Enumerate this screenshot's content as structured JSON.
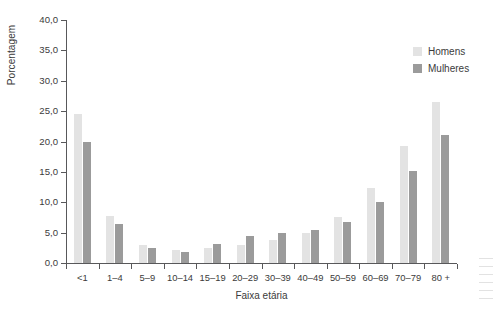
{
  "chart_data": {
    "type": "bar",
    "title": "",
    "xlabel": "Faixa etária",
    "ylabel": "Porcentagem",
    "ylim": [
      0,
      40
    ],
    "ytick_labels": [
      "0,0",
      "5,0",
      "10,0",
      "15,0",
      "20,0",
      "25,0",
      "30,0",
      "35,0",
      "40,0"
    ],
    "ytick_values": [
      0,
      5,
      10,
      15,
      20,
      25,
      30,
      35,
      40
    ],
    "grid": false,
    "legend_position": "top-right",
    "categories": [
      "<1",
      "1–4",
      "5–9",
      "10–14",
      "15–19",
      "20–29",
      "30–39",
      "40–49",
      "50–59",
      "60–69",
      "70–79",
      "80 +"
    ],
    "series": [
      {
        "name": "Homens",
        "color": "#e3e3e3",
        "values": [
          24.6,
          7.7,
          3.0,
          2.2,
          2.5,
          2.9,
          3.8,
          5.0,
          7.6,
          12.4,
          19.2,
          26.5
        ]
      },
      {
        "name": "Mulheres",
        "color": "#9b9b9b",
        "values": [
          19.9,
          6.4,
          2.5,
          1.8,
          3.2,
          4.5,
          4.9,
          5.5,
          6.8,
          10.0,
          15.2,
          21.0
        ]
      }
    ]
  },
  "legend": {
    "items": [
      {
        "label": "Homens",
        "color": "#e3e3e3"
      },
      {
        "label": "Mulheres",
        "color": "#9b9b9b"
      }
    ]
  },
  "axis": {
    "y_title": "Porcentagem",
    "x_title": "Faixa etária"
  }
}
